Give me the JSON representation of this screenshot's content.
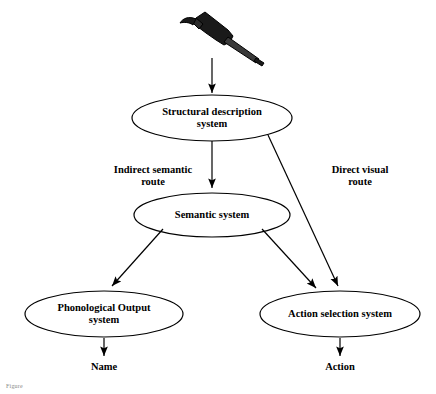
{
  "figure": {
    "caption": "Figure",
    "stimulus_icon": "hammer-icon",
    "nodes": [
      {
        "id": "structural",
        "label": "Structural description\nsystem",
        "cx": 212,
        "cy": 118,
        "rx": 80,
        "ry": 23
      },
      {
        "id": "semantic",
        "label": "Semantic system",
        "cx": 212,
        "cy": 215,
        "rx": 78,
        "ry": 22
      },
      {
        "id": "phonological",
        "label": "Phonological Output\nsystem",
        "cx": 104,
        "cy": 314,
        "rx": 79,
        "ry": 23
      },
      {
        "id": "action",
        "label": "Action selection system",
        "cx": 340,
        "cy": 314,
        "rx": 80,
        "ry": 23
      }
    ],
    "edge_labels": [
      {
        "id": "indirect-route",
        "text": "Indirect semantic\nroute",
        "x": 98,
        "y": 164,
        "w": 110
      },
      {
        "id": "direct-route",
        "text": "Direct visual\nroute",
        "x": 315,
        "y": 164,
        "w": 90
      }
    ],
    "terminals": [
      {
        "id": "name-output",
        "text": "Name",
        "x": 104,
        "y": 367
      },
      {
        "id": "action-output",
        "text": "Action",
        "x": 340,
        "y": 367
      }
    ],
    "colors": {
      "stroke": "#000000",
      "background": "#ffffff",
      "text": "#000000",
      "caption": "#8a8a8a"
    }
  }
}
